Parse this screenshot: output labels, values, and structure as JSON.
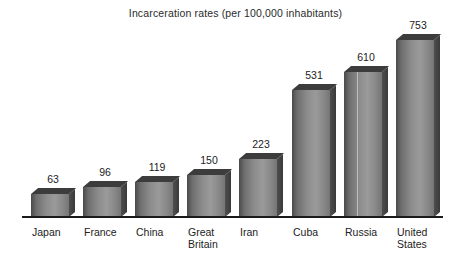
{
  "chart_data": {
    "type": "bar",
    "title": "Incarceration rates (per 100,000 inhabitants)",
    "xlabel": "",
    "ylabel": "",
    "ylim": [
      0,
      800
    ],
    "grid": false,
    "legend": null,
    "categories": [
      "Japan",
      "France",
      "China",
      "Great\nBritain",
      "Iran",
      "Cuba",
      "Russia",
      "United\nStates"
    ],
    "values": [
      63,
      96,
      119,
      150,
      223,
      531,
      610,
      753
    ],
    "value_labels": [
      "63",
      "96",
      "119",
      "150",
      "223",
      "531",
      "610",
      "753"
    ],
    "style": "3d-bar",
    "bar_color": "#8c8c8c",
    "bar_side_color": "#3a3a3a",
    "bar_top_color": "#3c3c3c",
    "axis_color": "#1a1a1a",
    "background_color": "#ffffff"
  },
  "bars": [
    {
      "label": "Japan",
      "value": 63,
      "value_label": "63",
      "left": 31,
      "width": 38,
      "height": 23,
      "streak": false
    },
    {
      "label": "France",
      "value": 96,
      "value_label": "96",
      "left": 83,
      "width": 38,
      "height": 30,
      "streak": false
    },
    {
      "label": "China",
      "value": 119,
      "value_label": "119",
      "left": 135,
      "width": 38,
      "height": 35,
      "streak": false
    },
    {
      "label": "Great\nBritain",
      "value": 150,
      "value_label": "150",
      "left": 187,
      "width": 38,
      "height": 42,
      "streak": false
    },
    {
      "label": "Iran",
      "value": 223,
      "value_label": "223",
      "left": 239,
      "width": 38,
      "height": 58,
      "streak": false
    },
    {
      "label": "Cuba",
      "value": 531,
      "value_label": "531",
      "left": 292,
      "width": 38,
      "height": 127,
      "streak": false
    },
    {
      "label": "Russia",
      "value": 610,
      "value_label": "610",
      "left": 344,
      "width": 38,
      "height": 145,
      "streak": true
    },
    {
      "label": "United\nStates",
      "value": 753,
      "value_label": "753",
      "left": 396,
      "width": 38,
      "height": 177,
      "streak": false
    }
  ]
}
